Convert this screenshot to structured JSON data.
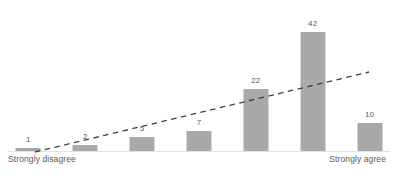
{
  "chart_data": {
    "type": "bar",
    "title": "",
    "subtitle": "",
    "xlabel": "",
    "ylabel": "",
    "categories": [
      "1",
      "2",
      "3",
      "4",
      "5",
      "6",
      "7"
    ],
    "values": [
      1,
      2,
      5,
      7,
      22,
      42,
      10
    ],
    "value_labels": [
      "1",
      "2",
      "5",
      "7",
      "22",
      "42",
      "10"
    ],
    "ylim": [
      0,
      46
    ],
    "grid": false,
    "legend": "none",
    "axis_endpoint_labels": {
      "left": "Strongly disagree",
      "right": "Strongly agree"
    },
    "annotations": [
      {
        "type": "trendline",
        "style": "dashed",
        "direction": "increasing"
      }
    ],
    "colors": {
      "bar": "#a9a9a9",
      "axis": "#e2e2e2",
      "trendline": "#3f3f3f",
      "label_text": "#595959"
    }
  }
}
